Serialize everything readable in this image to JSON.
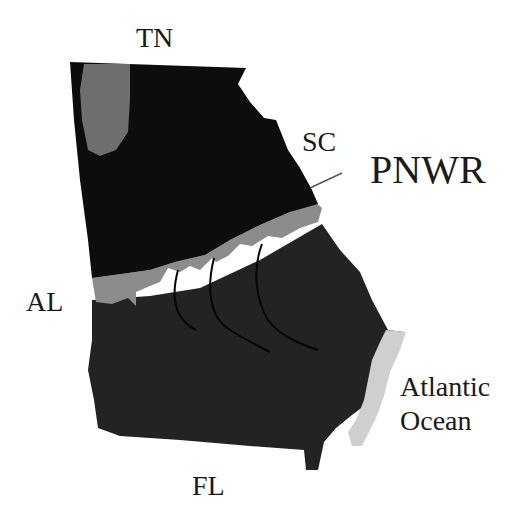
{
  "map": {
    "title": "Georgia map with PNWR location",
    "labels": {
      "tn": "TN",
      "sc": "SC",
      "pnwr": "PNWR",
      "al": "AL",
      "ocean_line1": "Atlantic",
      "ocean_line2": "Ocean",
      "fl": "FL"
    },
    "regions": [
      {
        "name": "northern-region",
        "color": "#0d0d0d"
      },
      {
        "name": "mountain-region",
        "color": "#6e6e6e"
      },
      {
        "name": "fall-line-band",
        "color": "#8c8c8c"
      },
      {
        "name": "southern-region",
        "color": "#232323"
      },
      {
        "name": "coastal-region",
        "color": "#cfcfcf"
      }
    ]
  }
}
